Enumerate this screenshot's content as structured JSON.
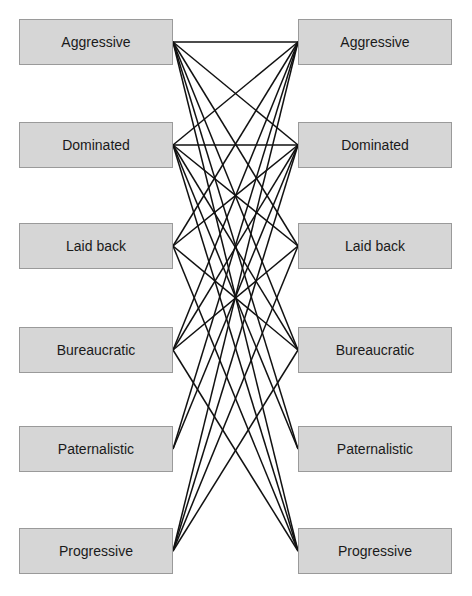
{
  "colors": {
    "box_fill": "#d6d6d6",
    "box_border": "#9a9a9a",
    "line": "#111111",
    "text": "#1a1a1a",
    "background": "#ffffff"
  },
  "left_column": {
    "items": [
      {
        "label": "Aggressive"
      },
      {
        "label": "Dominated"
      },
      {
        "label": "Laid back"
      },
      {
        "label": "Bureaucratic"
      },
      {
        "label": "Paternalistic"
      },
      {
        "label": "Progressive"
      }
    ]
  },
  "right_column": {
    "items": [
      {
        "label": "Aggressive"
      },
      {
        "label": "Dominated"
      },
      {
        "label": "Laid back"
      },
      {
        "label": "Bureaucratic"
      },
      {
        "label": "Paternalistic"
      },
      {
        "label": "Progressive"
      }
    ]
  },
  "connections": [
    {
      "from": 0,
      "to": [
        0,
        1,
        2,
        3,
        4,
        5
      ]
    },
    {
      "from": 1,
      "to": [
        0,
        1,
        2,
        3,
        4,
        5
      ]
    },
    {
      "from": 2,
      "to": [
        0,
        1,
        3,
        5
      ]
    },
    {
      "from": 3,
      "to": [
        0,
        1,
        2,
        5
      ]
    },
    {
      "from": 4,
      "to": [
        0,
        1
      ]
    },
    {
      "from": 5,
      "to": [
        0,
        1,
        2,
        3
      ]
    }
  ]
}
